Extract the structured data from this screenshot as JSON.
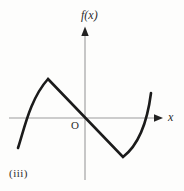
{
  "figure": {
    "caption": "(iii)",
    "y_axis_label": "f(x)",
    "x_axis_label": "x",
    "origin_label": "O",
    "curve_color": "#1b1b1b",
    "axis_color": "#9b9b9b",
    "arrow_color": "#222222",
    "background": "#fdfdfc"
  },
  "render": {
    "x_axis_path": "M 9 118 H 154",
    "y_axis_path": "M 85 33 V 180",
    "x_arrow_points": "154,114.3 163,118 154,121.7",
    "y_arrow_points": "81.3,36 85,26.5 88.7,36",
    "curve_path": "M 18 148 C 24 130, 30 99, 48 79 L 123 157 Q 145 140, 151 93",
    "curve_width": "2.6",
    "axis_width": "1.1"
  },
  "chart_data": {
    "type": "line",
    "title": "",
    "xlabel": "x",
    "ylabel": "f(x)",
    "caption": "(iii)",
    "axes_numbered": false,
    "grid": false,
    "legend": null,
    "xlim_est": [
      -2.4,
      2.6
    ],
    "ylim_est": [
      -1.6,
      1.8
    ],
    "key_points_est": {
      "left_end": [
        -2.16,
        -0.97
      ],
      "left_zero": [
        -1.94,
        0
      ],
      "sharp_maximum": [
        -1.19,
        1.26
      ],
      "origin": [
        0,
        0
      ],
      "sharp_minimum": [
        1.23,
        -1.26
      ],
      "right_zero": [
        2.03,
        0
      ],
      "right_end": [
        2.16,
        0.81
      ]
    },
    "series": [
      {
        "name": "f(x)",
        "x": [
          -2.16,
          -1.94,
          -1.6,
          -1.19,
          -0.6,
          0,
          0.6,
          1.23,
          1.6,
          2.03,
          2.16
        ],
        "y": [
          -0.97,
          0,
          0.9,
          1.26,
          0.63,
          0,
          -0.63,
          -1.26,
          -0.9,
          0,
          0.81
        ]
      }
    ]
  }
}
